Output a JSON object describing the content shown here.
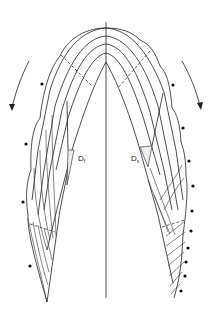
{
  "diagram": {
    "type": "schematic cross-section of layered growth (two-sided fold/shell)",
    "labels": {
      "left": {
        "main": "D",
        "sub": "f"
      },
      "right": {
        "main": "D",
        "sub": "s"
      }
    },
    "arrows": {
      "left": "arrow-down-left",
      "right": "arrow-down-right"
    },
    "dots": {
      "left": [
        [
          42,
          84
        ],
        [
          26,
          144
        ],
        [
          23,
          202
        ],
        [
          30,
          266
        ]
      ],
      "right": [
        [
          173,
          85
        ],
        [
          183,
          128
        ],
        [
          189,
          161
        ],
        [
          193,
          186
        ],
        [
          192,
          211
        ],
        [
          191,
          231
        ],
        [
          188,
          248
        ],
        [
          186,
          262
        ],
        [
          185,
          276
        ],
        [
          181,
          291
        ]
      ]
    },
    "colors": {
      "line": "#222222",
      "background": "#ffffff",
      "hatch": "#999999"
    }
  }
}
